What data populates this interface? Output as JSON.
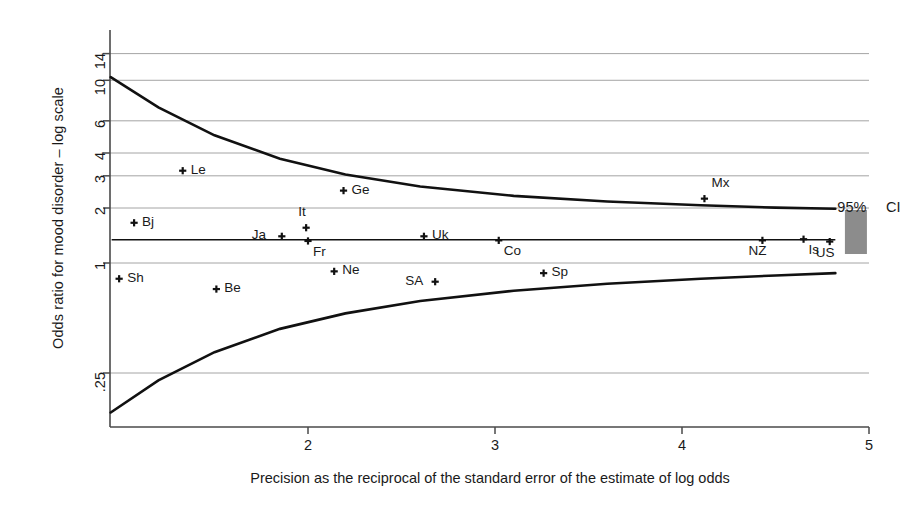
{
  "chart_data": {
    "type": "scatter",
    "title": "",
    "xlabel": "Precision as the reciprocal of the standard error of the estimate of log odds",
    "ylabel": "Odds ratio for mood disorder – log scale",
    "y_scale": "log",
    "xlim": [
      0.93,
      5.08
    ],
    "ylim": [
      0.12,
      16.5
    ],
    "xticks": [
      2,
      3,
      4,
      5
    ],
    "xtick_labels": [
      "2",
      "3",
      "4",
      "5"
    ],
    "yticks": [
      14,
      10,
      6,
      4,
      3,
      2,
      1,
      0.25
    ],
    "ytick_labels": [
      "14",
      "10",
      "6",
      "4",
      "3",
      "2",
      "1",
      ".25"
    ],
    "grid": "horizontal",
    "legend": "none",
    "points": [
      {
        "label": "Le",
        "x": 1.33,
        "y": 3.2,
        "label_pos": "right"
      },
      {
        "label": "Ge",
        "x": 2.19,
        "y": 2.49,
        "label_pos": "right"
      },
      {
        "label": "Mx",
        "x": 4.12,
        "y": 2.25,
        "label_pos": "above-right"
      },
      {
        "label": "Bj",
        "x": 1.07,
        "y": 1.66,
        "label_pos": "right"
      },
      {
        "label": "It",
        "x": 1.99,
        "y": 1.56,
        "label_pos": "above"
      },
      {
        "label": "Ja",
        "x": 1.86,
        "y": 1.4,
        "label_pos": "left"
      },
      {
        "label": "Fr",
        "x": 2.0,
        "y": 1.32,
        "label_pos": "below-right"
      },
      {
        "label": "Uk",
        "x": 2.62,
        "y": 1.4,
        "label_pos": "right"
      },
      {
        "label": "Co",
        "x": 3.02,
        "y": 1.33,
        "label_pos": "below-right"
      },
      {
        "label": "NZ",
        "x": 4.43,
        "y": 1.33,
        "label_pos": "below-left"
      },
      {
        "label": "Is",
        "x": 4.65,
        "y": 1.35,
        "label_pos": "below-right"
      },
      {
        "label": "US",
        "x": 4.79,
        "y": 1.31,
        "label_pos": "below-left"
      },
      {
        "label": "Ne",
        "x": 2.14,
        "y": 0.9,
        "label_pos": "right"
      },
      {
        "label": "Sh",
        "x": 0.99,
        "y": 0.82,
        "label_pos": "right"
      },
      {
        "label": "Be",
        "x": 1.51,
        "y": 0.72,
        "label_pos": "right"
      },
      {
        "label": "SA",
        "x": 2.68,
        "y": 0.79,
        "label_pos": "left"
      },
      {
        "label": "Sp",
        "x": 3.26,
        "y": 0.88,
        "label_pos": "right"
      }
    ],
    "pooled_line": {
      "value": 1.34,
      "from_x": 0.95,
      "to_x": 4.82
    },
    "funnel_upper": [
      {
        "x": 0.945,
        "y": 10.4
      },
      {
        "x": 1.2,
        "y": 7.1
      },
      {
        "x": 1.5,
        "y": 5.0
      },
      {
        "x": 1.85,
        "y": 3.72
      },
      {
        "x": 2.2,
        "y": 3.05
      },
      {
        "x": 2.6,
        "y": 2.62
      },
      {
        "x": 3.1,
        "y": 2.33
      },
      {
        "x": 3.6,
        "y": 2.17
      },
      {
        "x": 4.1,
        "y": 2.07
      },
      {
        "x": 4.5,
        "y": 2.01
      },
      {
        "x": 4.82,
        "y": 1.98
      }
    ],
    "funnel_lower": [
      {
        "x": 0.945,
        "y": 0.152
      },
      {
        "x": 1.2,
        "y": 0.228
      },
      {
        "x": 1.5,
        "y": 0.325
      },
      {
        "x": 1.85,
        "y": 0.436
      },
      {
        "x": 2.2,
        "y": 0.53
      },
      {
        "x": 2.6,
        "y": 0.62
      },
      {
        "x": 3.1,
        "y": 0.705
      },
      {
        "x": 3.6,
        "y": 0.77
      },
      {
        "x": 4.1,
        "y": 0.82
      },
      {
        "x": 4.5,
        "y": 0.855
      },
      {
        "x": 4.82,
        "y": 0.88
      }
    ],
    "annotations": [
      {
        "text": "95%",
        "x": 4.82,
        "y": 2.02
      },
      {
        "text": "CI",
        "x": 5.08,
        "y": 2.02
      }
    ],
    "ci_swatch": {
      "color": "#8c8c8c",
      "x": 4.93,
      "y_top": 1.95,
      "y_bottom": 1.12
    }
  },
  "axes": {
    "spine_color": "#4a4a4a",
    "grid_color": "#9a9a9a",
    "curve_color": "#111111",
    "text_color": "#1a1a1a"
  }
}
